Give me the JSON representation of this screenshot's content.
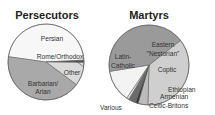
{
  "chart_data": [
    {
      "type": "pie",
      "title": "Persecutors",
      "slices": [
        {
          "label": "Persian",
          "value": 47,
          "color": "#f7f7f7"
        },
        {
          "label": "Rome/Orthodox",
          "value": 1,
          "color": "#555555"
        },
        {
          "label": "Other",
          "value": 10,
          "color": "#dadada"
        },
        {
          "label": "Barbarian/ Arian",
          "value": 42,
          "color": "#a9a9a9"
        }
      ],
      "center": [
        46,
        62
      ],
      "radius": 38
    },
    {
      "type": "pie",
      "title": "Martyrs",
      "slices": [
        {
          "label": "Eastern \"Nestorian\"",
          "value": 36,
          "color": "#cfcfcf"
        },
        {
          "label": "Coptic",
          "value": 4,
          "color": "#bcbcbc"
        },
        {
          "label": "Ethiopian",
          "value": 1,
          "color": "#333333"
        },
        {
          "label": "Armenian",
          "value": 3,
          "color": "#6b6b6b"
        },
        {
          "label": "Celtic-Britons",
          "value": 1,
          "color": "#dddddd"
        },
        {
          "label": "Various",
          "value": 13,
          "color": "#f3f3f3"
        },
        {
          "label": "Latin-Catholic",
          "value": 42,
          "color": "#9a9a9a"
        }
      ],
      "center": [
        149,
        65
      ],
      "radius": 40
    }
  ],
  "labels": {
    "persecutors_title": "Persecutors",
    "martyrs_title": "Martyrs",
    "persian": "Persian",
    "rome": "Rome/Orthodox",
    "other": "Other",
    "barbarian1": "Barbarian/",
    "barbarian2": "Arian",
    "eastern1": "Eastern",
    "eastern2": "\"Nestorian\"",
    "latin1": "Latin-",
    "latin2": "Catholic",
    "coptic": "Coptic",
    "ethiopian": "Ethiopian",
    "armenian": "Armenian",
    "celtic": "Celtic-Britons",
    "various": "Various"
  }
}
